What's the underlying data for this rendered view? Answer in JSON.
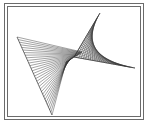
{
  "figure": {
    "frame": {
      "outer": {
        "x": 4,
        "y": 3,
        "w": 139,
        "h": 116
      },
      "inner": {
        "x": 7,
        "y": 6,
        "w": 133,
        "h": 110
      },
      "color": "#6b6b6b"
    },
    "line_color": "#333333",
    "left_envelope": {
      "edge_start": {
        "from": [
          17,
          37
        ],
        "to": [
          52,
          115
        ]
      },
      "edge_end": {
        "from": [
          82,
          52
        ],
        "to": [
          66,
          62
        ]
      },
      "count": 30
    },
    "right_envelope": {
      "edge_start": {
        "from": [
          100,
          13
        ],
        "to": [
          74,
          57
        ]
      },
      "edge_end": {
        "from": [
          74,
          57
        ],
        "to": [
          135,
          68
        ]
      },
      "count": 26
    }
  }
}
